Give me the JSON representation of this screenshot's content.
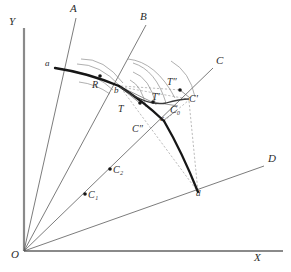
{
  "figure": {
    "title": "",
    "colors": {
      "axis": "#777777",
      "ray": "#555555",
      "curve": "#1a1a1a",
      "arc": "#777777",
      "dashed": "#999999",
      "dot": "#1a1a1a",
      "text": "#2b2b2b",
      "background": "#ffffff"
    },
    "axes": {
      "y_label": "Y",
      "x_label": "X",
      "origin_label": "O",
      "origin": {
        "x": 24,
        "y": 251
      },
      "y_top": {
        "x": 24,
        "y": 28
      },
      "x_right": {
        "x": 283,
        "y": 251
      }
    },
    "rays": [
      {
        "name": "ray-a",
        "label": "A",
        "label_x": 70,
        "label_y": 5,
        "end_x": 76,
        "end_y": 18
      },
      {
        "name": "ray-b",
        "label": "B",
        "label_x": 140,
        "label_y": 13,
        "end_x": 146,
        "end_y": 25
      },
      {
        "name": "ray-c",
        "label": "C",
        "label_x": 216,
        "label_y": 57,
        "end_x": 213,
        "end_y": 68
      },
      {
        "name": "ray-d",
        "label": "D",
        "label_x": 268,
        "label_y": 155,
        "end_x": 264,
        "end_y": 166
      }
    ],
    "points": [
      {
        "name": "point-a",
        "label": "a",
        "x": 55,
        "y": 68,
        "label_x": 45,
        "label_y": 62,
        "dot": false
      },
      {
        "name": "point-b",
        "label": "b",
        "x": 119,
        "y": 86,
        "label_x": 114,
        "label_y": 88,
        "dot": false
      },
      {
        "name": "point-c",
        "label": "c",
        "x": 164,
        "y": 121,
        "label_x": 161,
        "label_y": 117,
        "dot": false
      },
      {
        "name": "point-d",
        "label": "d",
        "x": 198,
        "y": 192,
        "label_x": 198,
        "label_y": 190,
        "dot": false
      },
      {
        "name": "point-r",
        "label": "R",
        "x": 100,
        "y": 76,
        "label_x": 93,
        "label_y": 82,
        "dot": true
      },
      {
        "name": "point-t",
        "label": "T",
        "x": 140,
        "y": 103,
        "label_x": 119,
        "label_y": 106,
        "dot": true
      },
      {
        "name": "point-t-prime",
        "label": "T'",
        "x": 153,
        "y": 102,
        "label_x": 153,
        "label_y": 95,
        "dot": true
      },
      {
        "name": "point-t-dprime",
        "label": "T″",
        "x": 180,
        "y": 90,
        "label_x": 168,
        "label_y": 80,
        "dot": true
      },
      {
        "name": "point-c-prime",
        "label": "C'",
        "x": 188,
        "y": 99,
        "label_x": 190,
        "label_y": 96,
        "dot": false
      },
      {
        "name": "point-c-zero",
        "label": "C₀",
        "x": 175,
        "y": 111,
        "label_x": 172,
        "label_y": 108,
        "dot": false
      },
      {
        "name": "point-c-dprime",
        "label": "C″",
        "x": 140,
        "y": 131,
        "label_x": 134,
        "label_y": 127,
        "dot": false
      },
      {
        "name": "point-c-one",
        "label": "C₁",
        "x": 85,
        "y": 194,
        "label_x": 88,
        "label_y": 194,
        "dot": true
      },
      {
        "name": "point-c-two",
        "label": "C₂",
        "x": 110,
        "y": 169,
        "label_x": 113,
        "label_y": 169,
        "dot": true
      }
    ],
    "curve_label": "a-b-c-d frontier curve",
    "notes": [
      "Thick solid curve runs a → b → c → d",
      "Dashed segments from C' to d and from b toward d",
      "Concentric arcs near b (indifference arcs)"
    ]
  }
}
